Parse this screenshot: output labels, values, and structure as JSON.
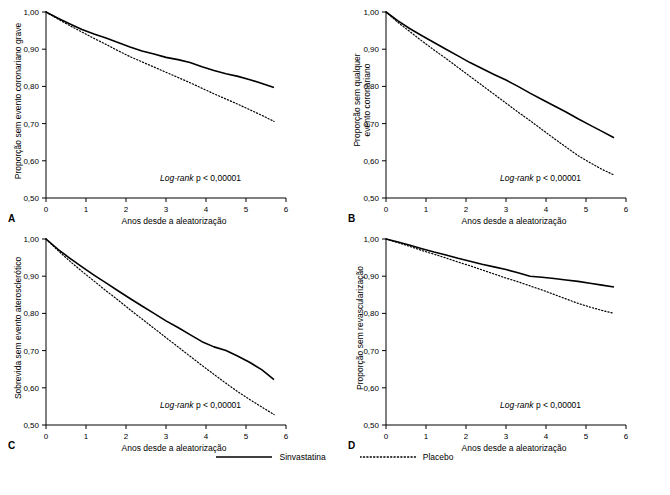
{
  "legend": {
    "items": [
      {
        "label": "Sinvastatina",
        "style": "solid"
      },
      {
        "label": "Placebo",
        "style": "dotted"
      }
    ]
  },
  "panels": [
    {
      "letter": "A",
      "ylabel": "Proporção sem evento coronariano grave",
      "xlabel": "Anos desde a aleatorização",
      "annotation_prefix": "Log-rank",
      "annotation_rest": " p < 0,00001"
    },
    {
      "letter": "B",
      "ylabel_line1": "Proporção sem qualquer",
      "ylabel_line2": "evento coronariano",
      "xlabel": "Anos desde a aleatorização",
      "annotation_prefix": "Log-rank",
      "annotation_rest": " p < 0,00001"
    },
    {
      "letter": "C",
      "ylabel": "Sobrevida sem evento aterosclerótico",
      "xlabel": "Anos desde a aleatorização",
      "annotation_prefix": "Log-rank",
      "annotation_rest": " p < 0,00001"
    },
    {
      "letter": "D",
      "ylabel": "Proporção sem revascularização",
      "xlabel": "Anos desde a aleatorização",
      "annotation_prefix": "Log-rank",
      "annotation_rest": " p < 0,00001"
    }
  ],
  "chart_data": [
    {
      "type": "line",
      "panel": "A",
      "title": "",
      "xlabel": "Anos desde a aleatorização",
      "ylabel": "Proporção sem evento coronariano grave",
      "xlim": [
        0,
        6
      ],
      "ylim": [
        0.5,
        1.0
      ],
      "xticks": [
        0,
        1,
        2,
        3,
        4,
        5,
        6
      ],
      "yticks": [
        0.5,
        0.6,
        0.7,
        0.8,
        0.9,
        1.0
      ],
      "ytick_labels": [
        "0,50",
        "0,60",
        "0,70",
        "0,80",
        "0,90",
        "1,00"
      ],
      "grid": false,
      "annotation": "Log-rank p < 0,00001",
      "series": [
        {
          "name": "Sinvastatina",
          "style": "solid",
          "x": [
            0,
            0.3,
            0.6,
            0.9,
            1.2,
            1.5,
            1.8,
            2.1,
            2.4,
            2.7,
            3.0,
            3.3,
            3.6,
            3.9,
            4.2,
            4.5,
            4.8,
            5.1,
            5.4,
            5.7
          ],
          "y": [
            1.0,
            0.983,
            0.968,
            0.953,
            0.941,
            0.93,
            0.918,
            0.906,
            0.895,
            0.887,
            0.878,
            0.872,
            0.864,
            0.853,
            0.843,
            0.834,
            0.827,
            0.818,
            0.808,
            0.797
          ]
        },
        {
          "name": "Placebo",
          "style": "dotted",
          "x": [
            0,
            0.3,
            0.6,
            0.9,
            1.2,
            1.5,
            1.8,
            2.1,
            2.4,
            2.7,
            3.0,
            3.3,
            3.6,
            3.9,
            4.2,
            4.5,
            4.8,
            5.1,
            5.4,
            5.7
          ],
          "y": [
            1.0,
            0.981,
            0.963,
            0.946,
            0.929,
            0.913,
            0.896,
            0.88,
            0.866,
            0.852,
            0.838,
            0.824,
            0.81,
            0.795,
            0.78,
            0.766,
            0.752,
            0.737,
            0.722,
            0.706
          ]
        }
      ]
    },
    {
      "type": "line",
      "panel": "B",
      "title": "",
      "xlabel": "Anos desde a aleatorização",
      "ylabel": "Proporção sem qualquer evento coronariano",
      "xlim": [
        0,
        6
      ],
      "ylim": [
        0.5,
        1.0
      ],
      "xticks": [
        0,
        1,
        2,
        3,
        4,
        5,
        6
      ],
      "yticks": [
        0.5,
        0.6,
        0.7,
        0.8,
        0.9,
        1.0
      ],
      "ytick_labels": [
        "0,50",
        "0,60",
        "0,70",
        "0,80",
        "0,90",
        "1,00"
      ],
      "grid": false,
      "annotation": "Log-rank p < 0,00001",
      "series": [
        {
          "name": "Sinvastatina",
          "style": "solid",
          "x": [
            0,
            0.3,
            0.6,
            0.9,
            1.2,
            1.5,
            1.8,
            2.1,
            2.4,
            2.7,
            3.0,
            3.3,
            3.6,
            3.9,
            4.2,
            4.5,
            4.8,
            5.1,
            5.4,
            5.7
          ],
          "y": [
            1.0,
            0.976,
            0.955,
            0.936,
            0.918,
            0.9,
            0.882,
            0.864,
            0.848,
            0.832,
            0.817,
            0.8,
            0.782,
            0.765,
            0.748,
            0.731,
            0.713,
            0.696,
            0.679,
            0.662
          ]
        },
        {
          "name": "Placebo",
          "style": "dotted",
          "x": [
            0,
            0.3,
            0.6,
            0.9,
            1.2,
            1.5,
            1.8,
            2.1,
            2.4,
            2.7,
            3.0,
            3.3,
            3.6,
            3.9,
            4.2,
            4.5,
            4.8,
            5.1,
            5.4,
            5.7
          ],
          "y": [
            1.0,
            0.972,
            0.947,
            0.922,
            0.898,
            0.875,
            0.851,
            0.827,
            0.803,
            0.779,
            0.755,
            0.731,
            0.708,
            0.684,
            0.66,
            0.637,
            0.614,
            0.595,
            0.577,
            0.562
          ]
        }
      ]
    },
    {
      "type": "line",
      "panel": "C",
      "title": "",
      "xlabel": "Anos desde a aleatorização",
      "ylabel": "Sobrevida sem evento aterosclerótico",
      "xlim": [
        0,
        6
      ],
      "ylim": [
        0.5,
        1.0
      ],
      "xticks": [
        0,
        1,
        2,
        3,
        4,
        5,
        6
      ],
      "yticks": [
        0.5,
        0.6,
        0.7,
        0.8,
        0.9,
        1.0
      ],
      "ytick_labels": [
        "0,50",
        "0,60",
        "0,70",
        "0,80",
        "0,90",
        "1,00"
      ],
      "grid": false,
      "annotation": "Log-rank p < 0,00001",
      "series": [
        {
          "name": "Sinvastatina",
          "style": "solid",
          "x": [
            0,
            0.3,
            0.6,
            0.9,
            1.2,
            1.5,
            1.8,
            2.1,
            2.4,
            2.7,
            3.0,
            3.3,
            3.6,
            3.9,
            4.2,
            4.5,
            4.8,
            5.1,
            5.4,
            5.7
          ],
          "y": [
            1.0,
            0.972,
            0.948,
            0.925,
            0.903,
            0.882,
            0.861,
            0.84,
            0.82,
            0.8,
            0.78,
            0.762,
            0.743,
            0.724,
            0.71,
            0.7,
            0.685,
            0.668,
            0.648,
            0.622
          ]
        },
        {
          "name": "Placebo",
          "style": "dotted",
          "x": [
            0,
            0.3,
            0.6,
            0.9,
            1.2,
            1.5,
            1.8,
            2.1,
            2.4,
            2.7,
            3.0,
            3.3,
            3.6,
            3.9,
            4.2,
            4.5,
            4.8,
            5.1,
            5.4,
            5.7
          ],
          "y": [
            1.0,
            0.969,
            0.94,
            0.913,
            0.887,
            0.861,
            0.836,
            0.81,
            0.785,
            0.76,
            0.735,
            0.71,
            0.685,
            0.66,
            0.636,
            0.612,
            0.589,
            0.568,
            0.548,
            0.528
          ]
        }
      ]
    },
    {
      "type": "line",
      "panel": "D",
      "title": "",
      "xlabel": "Anos desde a aleatorização",
      "ylabel": "Proporção sem revascularização",
      "xlim": [
        0,
        6
      ],
      "ylim": [
        0.5,
        1.0
      ],
      "xticks": [
        0,
        1,
        2,
        3,
        4,
        5,
        6
      ],
      "yticks": [
        0.5,
        0.6,
        0.7,
        0.8,
        0.9,
        1.0
      ],
      "ytick_labels": [
        "0,50",
        "0,60",
        "0,70",
        "0,80",
        "0,90",
        "1,00"
      ],
      "grid": false,
      "annotation": "Log-rank p < 0,00001",
      "series": [
        {
          "name": "Sinvastatina",
          "style": "solid",
          "x": [
            0,
            0.3,
            0.6,
            0.9,
            1.2,
            1.5,
            1.8,
            2.1,
            2.4,
            2.7,
            3.0,
            3.3,
            3.6,
            3.9,
            4.2,
            4.5,
            4.8,
            5.1,
            5.4,
            5.7
          ],
          "y": [
            1.0,
            0.992,
            0.983,
            0.974,
            0.965,
            0.957,
            0.948,
            0.94,
            0.932,
            0.925,
            0.918,
            0.909,
            0.9,
            0.897,
            0.894,
            0.89,
            0.886,
            0.881,
            0.876,
            0.871
          ]
        },
        {
          "name": "Placebo",
          "style": "dotted",
          "x": [
            0,
            0.3,
            0.6,
            0.9,
            1.2,
            1.5,
            1.8,
            2.1,
            2.4,
            2.7,
            3.0,
            3.3,
            3.6,
            3.9,
            4.2,
            4.5,
            4.8,
            5.1,
            5.4,
            5.7
          ],
          "y": [
            1.0,
            0.99,
            0.98,
            0.969,
            0.959,
            0.949,
            0.938,
            0.928,
            0.917,
            0.906,
            0.895,
            0.885,
            0.874,
            0.863,
            0.851,
            0.839,
            0.827,
            0.817,
            0.808,
            0.8
          ]
        }
      ]
    }
  ]
}
